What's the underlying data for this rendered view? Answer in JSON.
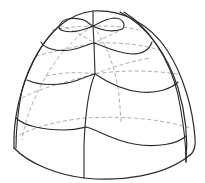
{
  "figure": {
    "width": 205,
    "height": 183,
    "colors": {
      "background": "#ffffff",
      "visible_line": "#2a2a2a",
      "hidden_line": "#9a9a9a"
    },
    "outline": [
      {
        "name": "silhouette",
        "d": "M14,148 C13,120 20,88 34,60 C48,32 68,14 93,11 C122,9 150,24 167,50 C184,76 193,110 195,138 C196,148 194,152 190,155"
      },
      {
        "name": "base-rim",
        "d": "M14,148 C30,165 60,175 84,178 C120,182 165,176 190,155"
      },
      {
        "name": "inner-right-edge",
        "d": "M120,12 C148,26 168,56 178,88 C186,115 188,140 186,162"
      }
    ],
    "visible_lines": [
      {
        "name": "front-meridian-upper",
        "d": "M93,11 L93,26 L94,43 L95,74"
      },
      {
        "name": "front-meridian-lower",
        "d": "M95,74 C88,90 85,120 84,145 L84,178"
      },
      {
        "name": "top-lobe-contour",
        "d": "M60,25 C62,18 75,17 84,20 C88,22 90,25 93,26 C98,24 104,19 114,18 C124,18 126,26 122,29 C112,33 100,30 93,26 C84,30 72,33 64,31 C59,30 58,27 60,25"
      },
      {
        "name": "contour-2",
        "d": "M41,42 C44,48 56,52 70,50 C82,48 88,44 94,43 C104,46 116,53 132,54 C145,54 150,48 152,42"
      },
      {
        "name": "contour-3",
        "d": "M27,80 C40,86 62,86 78,80 C86,77 91,75 95,74 C104,80 120,90 140,92 C158,94 172,88 178,82"
      },
      {
        "name": "contour-4",
        "d": "M16,118 C24,126 44,130 64,130 C76,130 82,128 86,127 C98,130 112,140 134,144 C156,148 178,144 186,136"
      },
      {
        "name": "right-meridian",
        "d": "M124,12 C150,28 170,60 178,95 C183,120 186,140 186,162"
      },
      {
        "name": "left-meridian-near",
        "d": "M60,25 C44,40 30,62 22,90 C18,110 16,130 16,148"
      }
    ],
    "hidden_lines": [
      {
        "name": "hidden-contour-top",
        "d": "M52,30 C64,28 78,26 93,26 C110,26 124,26 138,30"
      },
      {
        "name": "hidden-contour-2",
        "d": "M36,56 C50,52 70,48 94,43 C116,42 140,44 160,50"
      },
      {
        "name": "hidden-contour-3",
        "d": "M22,98 C40,88 66,82 95,74 C120,70 150,70 178,74"
      },
      {
        "name": "hidden-contour-4",
        "d": "M14,138 C34,126 64,120 86,118 C120,116 158,118 190,128"
      },
      {
        "name": "hidden-meridian-back",
        "d": "M93,26 C105,42 112,60 116,78 C120,95 120,110 121,122"
      },
      {
        "name": "hidden-meridian-left",
        "d": "M93,26 C70,40 50,64 36,96 C28,112 24,128 22,140"
      },
      {
        "name": "hidden-diag-left",
        "d": "M60,25 C72,30 84,36 94,43"
      },
      {
        "name": "hidden-diag-right",
        "d": "M124,28 C114,34 104,38 94,43"
      },
      {
        "name": "hidden-junction-right",
        "d": "M95,74 C110,68 128,62 150,58"
      },
      {
        "name": "hidden-junction-left",
        "d": "M95,74 C80,72 64,72 46,76"
      }
    ]
  }
}
